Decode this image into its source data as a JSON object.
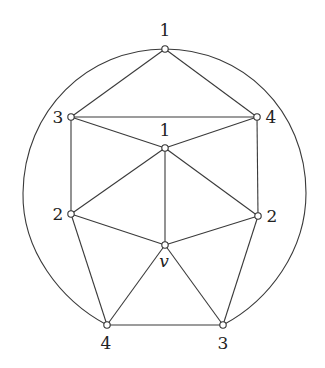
{
  "diagram": {
    "type": "planar-graph",
    "colors": {
      "line": "#3a3a3a",
      "vertex_fill": "#ffffff",
      "text": "#222222"
    },
    "vertices": [
      {
        "id": "top",
        "label": "1",
        "x": 165,
        "y": 49,
        "lx": 165,
        "ly": 36,
        "italic": false
      },
      {
        "id": "L3",
        "label": "3",
        "x": 71,
        "y": 117,
        "lx": 58,
        "ly": 123,
        "italic": false
      },
      {
        "id": "R4",
        "label": "4",
        "x": 257,
        "y": 117,
        "lx": 271,
        "ly": 123,
        "italic": false
      },
      {
        "id": "mid1",
        "label": "1",
        "x": 165,
        "y": 148,
        "lx": 165,
        "ly": 136,
        "italic": false
      },
      {
        "id": "L2",
        "label": "2",
        "x": 71,
        "y": 214,
        "lx": 58,
        "ly": 220,
        "italic": false
      },
      {
        "id": "R2",
        "label": "2",
        "x": 258,
        "y": 216,
        "lx": 272,
        "ly": 222,
        "italic": false
      },
      {
        "id": "v",
        "label": "v",
        "x": 165,
        "y": 245,
        "lx": 164,
        "ly": 267,
        "italic": true
      },
      {
        "id": "B4",
        "label": "4",
        "x": 107,
        "y": 325,
        "lx": 106,
        "ly": 349,
        "italic": false
      },
      {
        "id": "B3",
        "label": "3",
        "x": 223,
        "y": 325,
        "lx": 223,
        "ly": 349,
        "italic": false
      }
    ],
    "edges": [
      [
        "top",
        "L3"
      ],
      [
        "top",
        "R4"
      ],
      [
        "L3",
        "R4"
      ],
      [
        "L3",
        "mid1"
      ],
      [
        "R4",
        "mid1"
      ],
      [
        "L3",
        "L2"
      ],
      [
        "R4",
        "R2"
      ],
      [
        "mid1",
        "L2"
      ],
      [
        "mid1",
        "R2"
      ],
      [
        "mid1",
        "v"
      ],
      [
        "L2",
        "v"
      ],
      [
        "R2",
        "v"
      ],
      [
        "L2",
        "B4"
      ],
      [
        "R2",
        "B3"
      ],
      [
        "v",
        "B4"
      ],
      [
        "v",
        "B3"
      ],
      [
        "B4",
        "B3"
      ]
    ],
    "outer_arc": {
      "from": "B4",
      "through": "top",
      "to": "B3"
    }
  }
}
